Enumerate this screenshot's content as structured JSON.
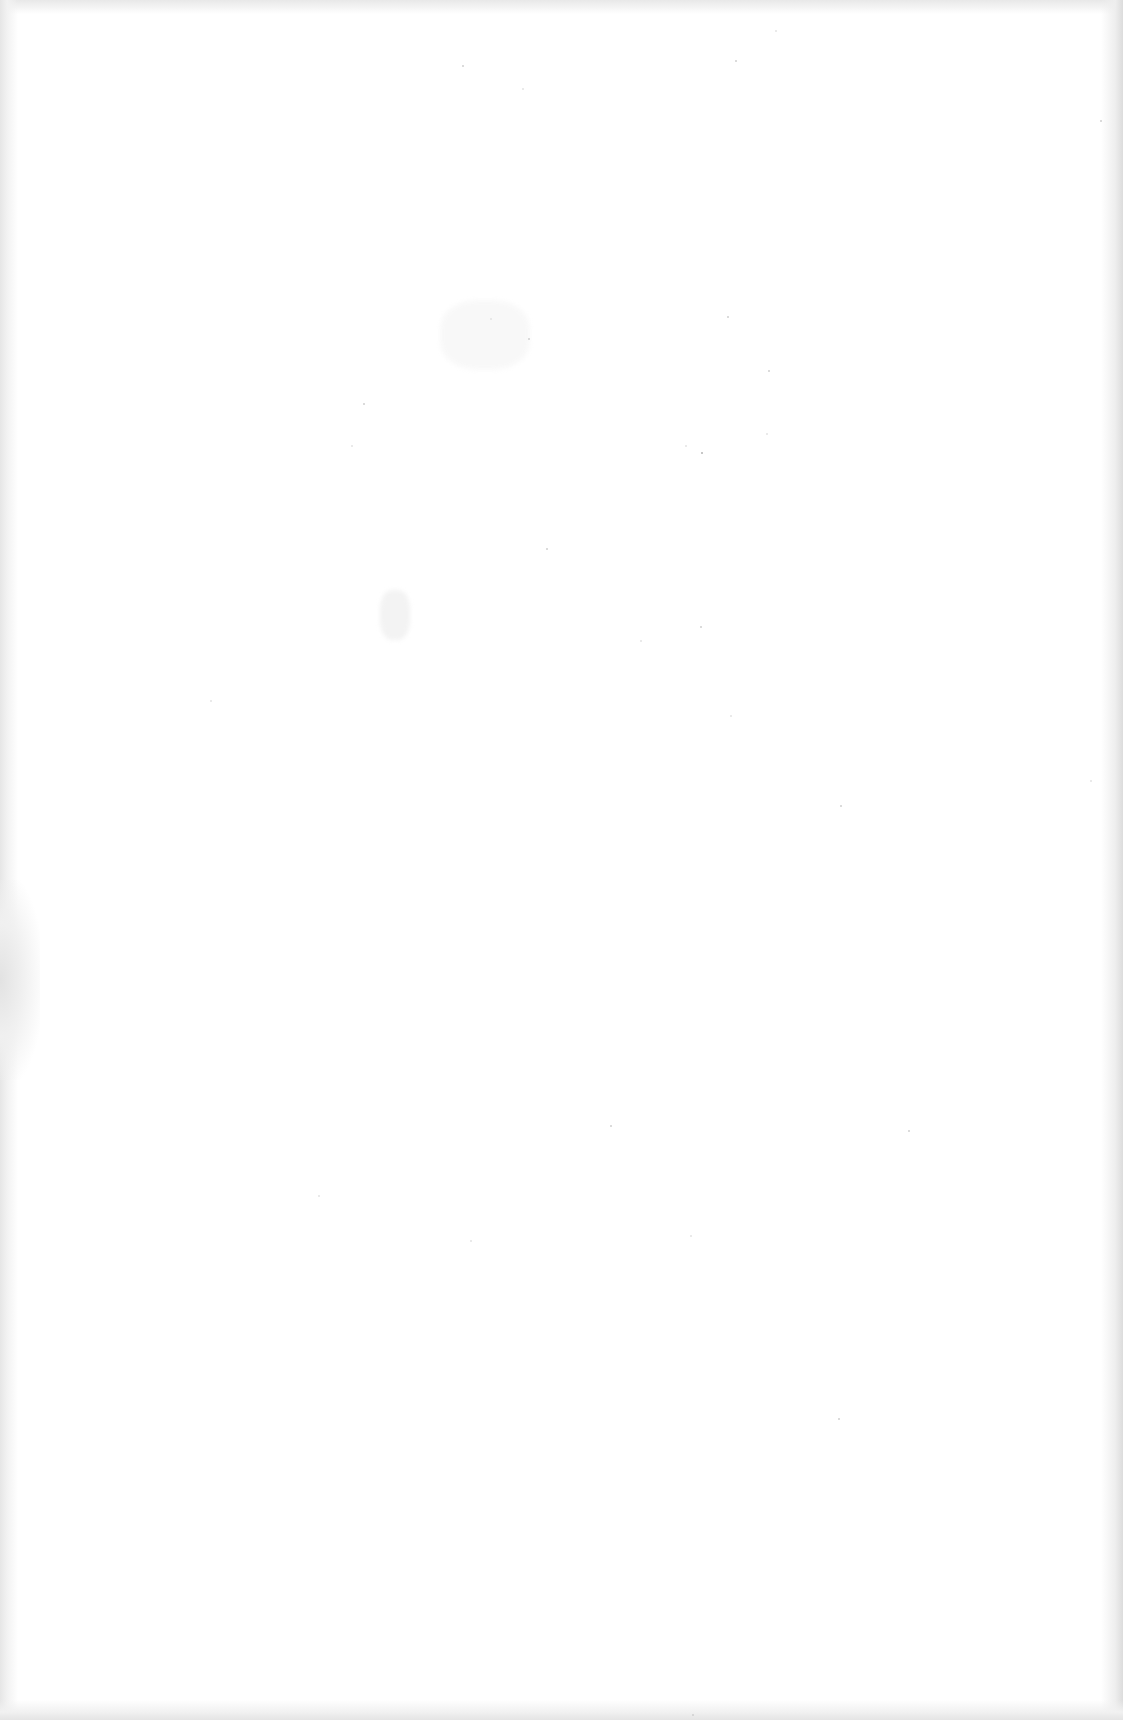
{
  "document": {
    "type": "scanned-page",
    "content": [],
    "is_blank": true,
    "colors": {
      "paper": "#ffffff",
      "edge_shade": "#e4e4e4",
      "noise": "#cfcfcf"
    }
  }
}
